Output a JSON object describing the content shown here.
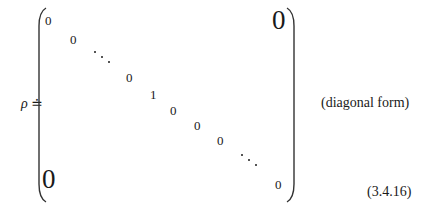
{
  "equation": {
    "lhs": "ρ ≐",
    "matrix": {
      "entries": [
        {
          "text": "0",
          "x": 45,
          "y": 14
        },
        {
          "text": "0",
          "x": 70,
          "y": 33
        },
        {
          "text": "0",
          "x": 126,
          "y": 71
        },
        {
          "text": "1",
          "x": 150,
          "y": 88
        },
        {
          "text": "0",
          "x": 170,
          "y": 104
        },
        {
          "text": "0",
          "x": 194,
          "y": 119
        },
        {
          "text": "0",
          "x": 217,
          "y": 134
        },
        {
          "text": "0",
          "x": 275,
          "y": 178
        }
      ],
      "big_zero_upper_right": "0",
      "big_zero_lower_left": "0"
    },
    "annotation": "(diagonal form)",
    "number": "(3.4.16)"
  }
}
